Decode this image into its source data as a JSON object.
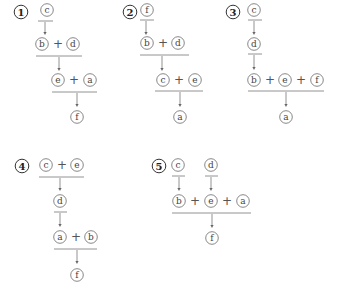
{
  "options": [
    {
      "number": "1",
      "rows": [
        {
          "terms": [
            "c"
          ]
        },
        {
          "terms": [
            "b",
            "d"
          ]
        },
        {
          "terms": [
            "e",
            "a"
          ]
        },
        {
          "terms": [
            "f"
          ]
        }
      ]
    },
    {
      "number": "2",
      "rows": [
        {
          "terms": [
            "f"
          ]
        },
        {
          "terms": [
            "b",
            "d"
          ]
        },
        {
          "terms": [
            "c",
            "e"
          ]
        },
        {
          "terms": [
            "a"
          ]
        }
      ]
    },
    {
      "number": "3",
      "rows": [
        {
          "terms": [
            "c"
          ]
        },
        {
          "terms": [
            "d"
          ]
        },
        {
          "terms": [
            "b",
            "e",
            "f"
          ]
        },
        {
          "terms": [
            "a"
          ]
        }
      ]
    },
    {
      "number": "4",
      "rows": [
        {
          "terms": [
            "c",
            "e"
          ]
        },
        {
          "terms": [
            "d"
          ]
        },
        {
          "terms": [
            "a",
            "b"
          ]
        },
        {
          "terms": [
            "f"
          ]
        }
      ]
    },
    {
      "number": "5",
      "rows": [
        {
          "terms": [
            "c",
            "d"
          ],
          "separate": true
        },
        {
          "terms": [
            "b",
            "e",
            "a"
          ]
        },
        {
          "terms": [
            "f"
          ]
        }
      ]
    }
  ],
  "operator": "+"
}
